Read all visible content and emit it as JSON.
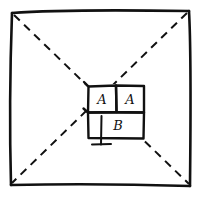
{
  "diagram": {
    "type": "hand-drawn-sketch",
    "title": "",
    "colors": {
      "ink": "#111111",
      "background": "#ffffff"
    },
    "outer_frame": {
      "shape": "square",
      "style": "solid",
      "path": "M 12 12 L 189 10 L 190 186 L 11 184 Z"
    },
    "diagonals": [
      {
        "name": "diagonal-top-left-to-bottom-right",
        "style": "dashed",
        "from": [
          13,
          13
        ],
        "to": [
          189,
          185
        ]
      },
      {
        "name": "diagonal-top-right-to-bottom-left",
        "style": "dashed",
        "from": [
          188,
          12
        ],
        "to": [
          12,
          184
        ]
      }
    ],
    "cells": [
      {
        "name": "cell-a-left",
        "label": "A",
        "x": 88,
        "y": 85,
        "width": 28,
        "height": 27
      },
      {
        "name": "cell-a-right",
        "label": "A",
        "x": 116,
        "y": 85,
        "width": 28,
        "height": 27
      },
      {
        "name": "cell-b",
        "label": "B",
        "x": 88,
        "y": 112,
        "width": 56,
        "height": 26
      }
    ],
    "ground_symbol": {
      "name": "ground-stem",
      "stem_from": [
        101,
        116
      ],
      "stem_to": [
        101,
        144
      ],
      "base_from": [
        92,
        144
      ],
      "base_to": [
        111,
        144
      ]
    }
  }
}
